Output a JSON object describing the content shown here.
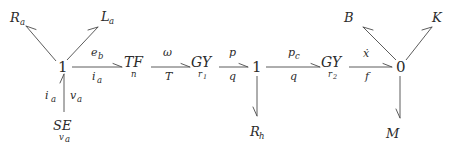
{
  "diagram": {
    "type": "bond-graph",
    "background_color": "#ffffff",
    "line_color": "#4a4a4a",
    "text_color": "#2b2b2b"
  },
  "junctions": [
    {
      "id": "j1-electrical",
      "label": "1",
      "x": 62,
      "y": 67
    },
    {
      "id": "j1-hydraulic",
      "label": "1",
      "x": 256,
      "y": 67
    },
    {
      "id": "j0-mechanical",
      "label": "0",
      "x": 400,
      "y": 67
    }
  ],
  "elements": [
    {
      "id": "tf",
      "main": "TF",
      "sub": "n",
      "x": 131,
      "y": 63
    },
    {
      "id": "gy1",
      "main": "GY",
      "sub": "r",
      "sub2": "1",
      "x": 199,
      "y": 63
    },
    {
      "id": "gy2",
      "main": "GY",
      "sub": "r",
      "sub2": "2",
      "x": 329,
      "y": 63
    }
  ],
  "components": [
    {
      "id": "ra",
      "label": "R",
      "sub": "a",
      "x": 10,
      "y": 18
    },
    {
      "id": "la",
      "label": "L",
      "sub": "a",
      "x": 103,
      "y": 17
    },
    {
      "id": "se",
      "label": "SE",
      "sub": "v",
      "sub2": "a",
      "x": 60,
      "y": 126
    },
    {
      "id": "rh",
      "label": "R",
      "sub": "h",
      "x": 256,
      "y": 133
    },
    {
      "id": "b",
      "label": "B",
      "sub": "",
      "x": 345,
      "y": 18
    },
    {
      "id": "k",
      "label": "K",
      "sub": "",
      "x": 434,
      "y": 18
    },
    {
      "id": "m",
      "label": "M",
      "sub": "",
      "x": 388,
      "y": 134
    }
  ],
  "bond_labels": [
    {
      "id": "bond-eb-ia",
      "effort": "e",
      "effort_sub": "b",
      "flow": "i",
      "flow_sub": "a",
      "x": 97,
      "y": 63
    },
    {
      "id": "bond-omega-T",
      "effort": "ω",
      "effort_sub": "",
      "flow": "T",
      "flow_sub": "",
      "x": 166,
      "y": 63
    },
    {
      "id": "bond-p-q",
      "effort": "p",
      "effort_sub": "",
      "flow": "q",
      "flow_sub": "",
      "x": 230,
      "y": 63
    },
    {
      "id": "bond-pc-q",
      "effort": "p",
      "effort_sub": "c",
      "flow": "q",
      "flow_sub": "",
      "x": 294,
      "y": 63
    },
    {
      "id": "bond-xdot-f",
      "effort": "ẋ",
      "effort_sub": "",
      "flow": "f",
      "flow_sub": "",
      "x": 364,
      "y": 63
    },
    {
      "id": "bond-ia-va-left",
      "text": "i",
      "text_sub": "a",
      "x": 49,
      "y": 96
    },
    {
      "id": "bond-ia-va-right",
      "text": "v",
      "text_sub": "a",
      "x": 73,
      "y": 96
    }
  ],
  "bonds": [
    {
      "id": "bond-junction1-to-Ra",
      "from": "j1-electrical",
      "to": "ra",
      "direction": "outward"
    },
    {
      "id": "bond-junction1-to-La",
      "from": "j1-electrical",
      "to": "la",
      "direction": "outward"
    },
    {
      "id": "bond-SE-to-junction1",
      "from": "se",
      "to": "j1-electrical",
      "direction": "inward"
    },
    {
      "id": "bond-junction1-to-TF",
      "from": "j1-electrical",
      "to": "tf",
      "direction": "outward"
    },
    {
      "id": "bond-TF-to-GY1",
      "from": "tf",
      "to": "gy1",
      "direction": "outward"
    },
    {
      "id": "bond-GY1-to-junction1h",
      "from": "gy1",
      "to": "j1-hydraulic",
      "direction": "outward"
    },
    {
      "id": "bond-junction1h-to-Rh",
      "from": "j1-hydraulic",
      "to": "rh",
      "direction": "outward"
    },
    {
      "id": "bond-junction1h-to-GY2",
      "from": "j1-hydraulic",
      "to": "gy2",
      "direction": "outward"
    },
    {
      "id": "bond-GY2-to-junction0",
      "from": "gy2",
      "to": "j0-mechanical",
      "direction": "outward"
    },
    {
      "id": "bond-junction0-to-B",
      "from": "j0-mechanical",
      "to": "b",
      "direction": "outward"
    },
    {
      "id": "bond-junction0-to-K",
      "from": "j0-mechanical",
      "to": "k",
      "direction": "outward"
    },
    {
      "id": "bond-junction0-to-M",
      "from": "j0-mechanical",
      "to": "m",
      "direction": "outward"
    }
  ]
}
